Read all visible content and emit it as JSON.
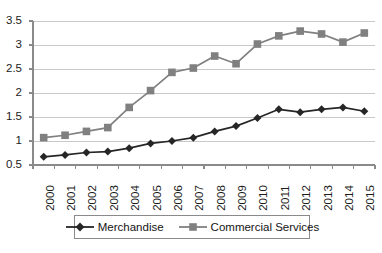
{
  "chart_data": {
    "type": "line",
    "title": "",
    "subtitle": "",
    "xlabel": "",
    "ylabel": "",
    "categories": [
      "2000",
      "2001",
      "2002",
      "2003",
      "2004",
      "2005",
      "2006",
      "2007",
      "2008",
      "2009",
      "2010",
      "2011",
      "2012",
      "2013",
      "2014",
      "2015"
    ],
    "ylim": [
      0.5,
      3.5
    ],
    "ytick_labels": [
      "0.5",
      "1",
      "1.5",
      "2",
      "2.5",
      "3",
      "3.5"
    ],
    "ytick_values": [
      0.5,
      1,
      1.5,
      2,
      2.5,
      3,
      3.5
    ],
    "grid": true,
    "legend_position": "bottom",
    "series": [
      {
        "name": "Merchandise",
        "marker": "diamond",
        "color": "#262626",
        "values": [
          0.67,
          0.71,
          0.76,
          0.78,
          0.85,
          0.95,
          1.0,
          1.07,
          1.2,
          1.31,
          1.48,
          1.66,
          1.6,
          1.66,
          1.7,
          1.62
        ]
      },
      {
        "name": "Commercial Services",
        "marker": "square",
        "color": "#808080",
        "values": [
          1.07,
          1.12,
          1.2,
          1.28,
          1.7,
          2.05,
          2.43,
          2.52,
          2.77,
          2.61,
          3.02,
          3.19,
          3.29,
          3.23,
          3.06,
          3.25
        ]
      }
    ]
  },
  "legend": {
    "items": [
      {
        "label": "Merchandise"
      },
      {
        "label": "Commercial Services"
      }
    ]
  },
  "colors": {
    "merchandise": "#262626",
    "commercial_services": "#808080",
    "gridline": "#c9c9c9",
    "axis": "#8a8a8a",
    "text": "#1c1c1c"
  }
}
